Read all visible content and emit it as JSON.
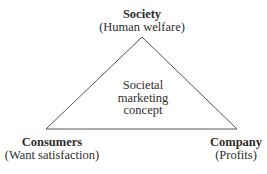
{
  "diagram": {
    "type": "triangle",
    "center_label": [
      "Societal",
      "marketing",
      "concept"
    ],
    "vertices": {
      "top": {
        "title": "Society",
        "subtitle": "(Human welfare)"
      },
      "bottom_left": {
        "title": "Consumers",
        "subtitle": "(Want satisfaction)"
      },
      "bottom_right": {
        "title": "Company",
        "subtitle": "(Profits)"
      }
    },
    "colors": {
      "line": "#555555",
      "text": "#2e2e2e",
      "background": "#ffffff"
    }
  }
}
